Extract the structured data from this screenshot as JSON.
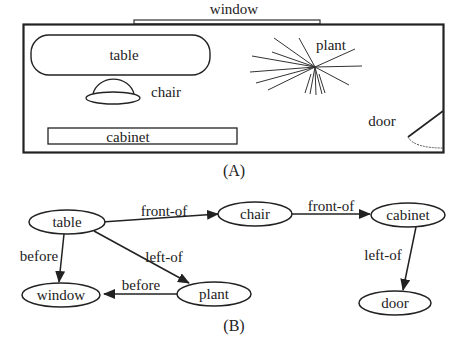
{
  "panel_a": {
    "caption": "(A)",
    "window_label": "window",
    "objects": {
      "table": "table",
      "chair": "chair",
      "plant": "plant",
      "cabinet": "cabinet",
      "door": "door"
    }
  },
  "panel_b": {
    "caption": "(B)",
    "nodes": {
      "table": "table",
      "chair": "chair",
      "cabinet": "cabinet",
      "window": "window",
      "plant": "plant",
      "door": "door"
    },
    "edges": [
      {
        "from": "table",
        "to": "chair",
        "label": "front-of"
      },
      {
        "from": "chair",
        "to": "cabinet",
        "label": "front-of"
      },
      {
        "from": "table",
        "to": "window",
        "label": "before"
      },
      {
        "from": "table",
        "to": "plant",
        "label": "left-of"
      },
      {
        "from": "plant",
        "to": "window",
        "label": "before"
      },
      {
        "from": "cabinet",
        "to": "door",
        "label": "left-of"
      }
    ]
  }
}
